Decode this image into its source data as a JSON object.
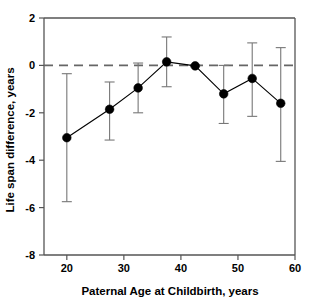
{
  "chart_data": {
    "type": "line",
    "title": "",
    "subtitle": "",
    "xlabel": "Paternal Age at Childbirth, years",
    "ylabel": "Life span difference, years",
    "xlim": [
      16,
      60
    ],
    "ylim": [
      -8,
      2
    ],
    "xticks": [
      20,
      30,
      40,
      50,
      60
    ],
    "xtick_labels": [
      "20",
      "30",
      "40",
      "50",
      "60"
    ],
    "yticks": [
      2,
      0,
      -2,
      -4,
      -6,
      -8
    ],
    "ytick_labels": [
      "2",
      "0",
      "-2",
      "-4",
      "-6",
      "-8"
    ],
    "grid": false,
    "legend": null,
    "annotations": [
      {
        "name": "zero-reference-line",
        "type": "hline",
        "y": 0,
        "style": "dashed"
      }
    ],
    "series": [
      {
        "name": "Life span difference",
        "marker": "filled-circle",
        "x": [
          20.0,
          27.5,
          32.5,
          37.5,
          42.5,
          47.5,
          52.5,
          57.5
        ],
        "values": [
          -3.05,
          -1.85,
          -0.95,
          0.15,
          -0.02,
          -1.2,
          -0.55,
          -1.6
        ],
        "error_low": [
          -5.75,
          -3.15,
          -2.0,
          -0.9,
          -0.05,
          -2.45,
          -2.15,
          -4.05
        ],
        "error_high": [
          -0.35,
          -0.7,
          0.1,
          1.2,
          0.02,
          0.0,
          0.95,
          0.75
        ]
      }
    ]
  }
}
